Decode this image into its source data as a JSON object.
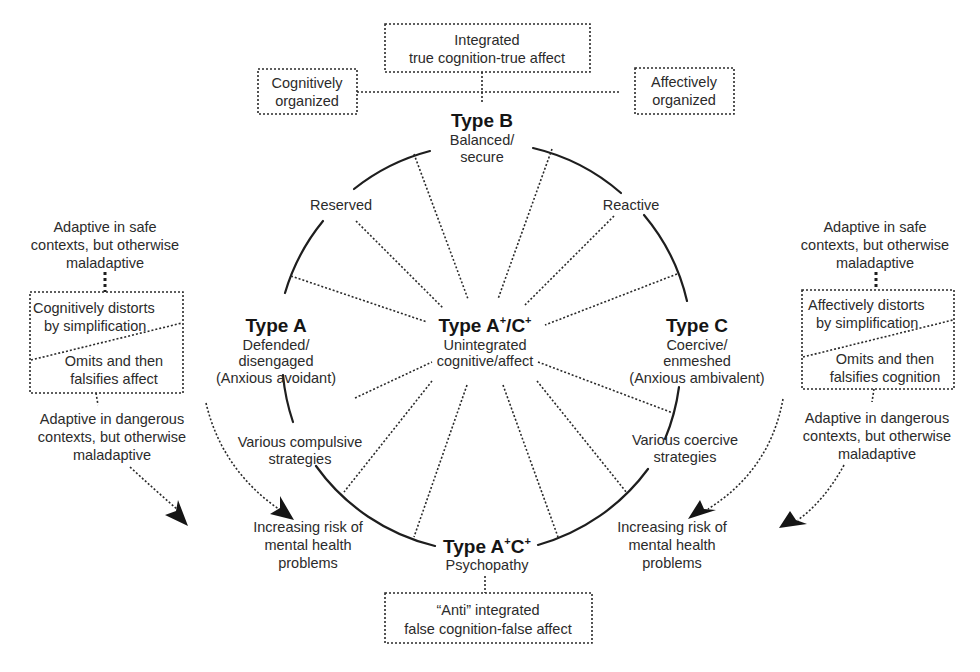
{
  "diagram": {
    "top_box": {
      "line1": "Integrated",
      "line2": "true cognition-true affect"
    },
    "cognitive_box": {
      "line1": "Cognitively",
      "line2": "organized"
    },
    "affective_box": {
      "line1": "Affectively",
      "line2": "organized"
    },
    "type_b": {
      "title": "Type B",
      "line1": "Balanced/",
      "line2": "secure"
    },
    "reserved": "Reserved",
    "reactive": "Reactive",
    "type_a": {
      "title": "Type A",
      "line1": "Defended/",
      "line2": "disengaged",
      "line3": "(Anxious avoidant)"
    },
    "type_c": {
      "title": "Type C",
      "line1": "Coercive/",
      "line2": "enmeshed",
      "line3": "(Anxious ambivalent)"
    },
    "type_ac_center": {
      "title_main": "Type A",
      "sup1": "+",
      "title_sep": "/C",
      "sup2": "+",
      "line1": "Unintegrated",
      "line2": "cognitive/affect"
    },
    "compulsive": {
      "line1": "Various compulsive",
      "line2": "strategies"
    },
    "coercive": {
      "line1": "Various coercive",
      "line2": "strategies"
    },
    "type_ac_bottom": {
      "title_main": "Type A",
      "sup1": "+",
      "title_sep": "C",
      "sup2": "+",
      "line1": "Psychopathy"
    },
    "bottom_box": {
      "line1": "“Anti” integrated",
      "line2": "false cognition-false affect"
    },
    "risk_left": {
      "line1": "Increasing risk of",
      "line2": "mental health",
      "line3": "problems"
    },
    "risk_right": {
      "line1": "Increasing risk of",
      "line2": "mental health",
      "line3": "problems"
    },
    "left_panel": {
      "safe": {
        "line1": "Adaptive in safe",
        "line2": "contexts, but otherwise",
        "line3": "maladaptive"
      },
      "box_top": {
        "line1": "Cognitively distorts",
        "line2": "by simplification"
      },
      "box_bottom": {
        "line1": "Omits and then",
        "line2": "falsifies affect"
      },
      "danger": {
        "line1": "Adaptive in dangerous",
        "line2": "contexts, but otherwise",
        "line3": "maladaptive"
      }
    },
    "right_panel": {
      "safe": {
        "line1": "Adaptive in safe",
        "line2": "contexts, but otherwise",
        "line3": "maladaptive"
      },
      "box_top": {
        "line1": "Affectively distorts",
        "line2": "by simplification"
      },
      "box_bottom": {
        "line1": "Omits and then",
        "line2": "falsifies cognition"
      },
      "danger": {
        "line1": "Adaptive in dangerous",
        "line2": "contexts, but otherwise",
        "line3": "maladaptive"
      }
    }
  }
}
